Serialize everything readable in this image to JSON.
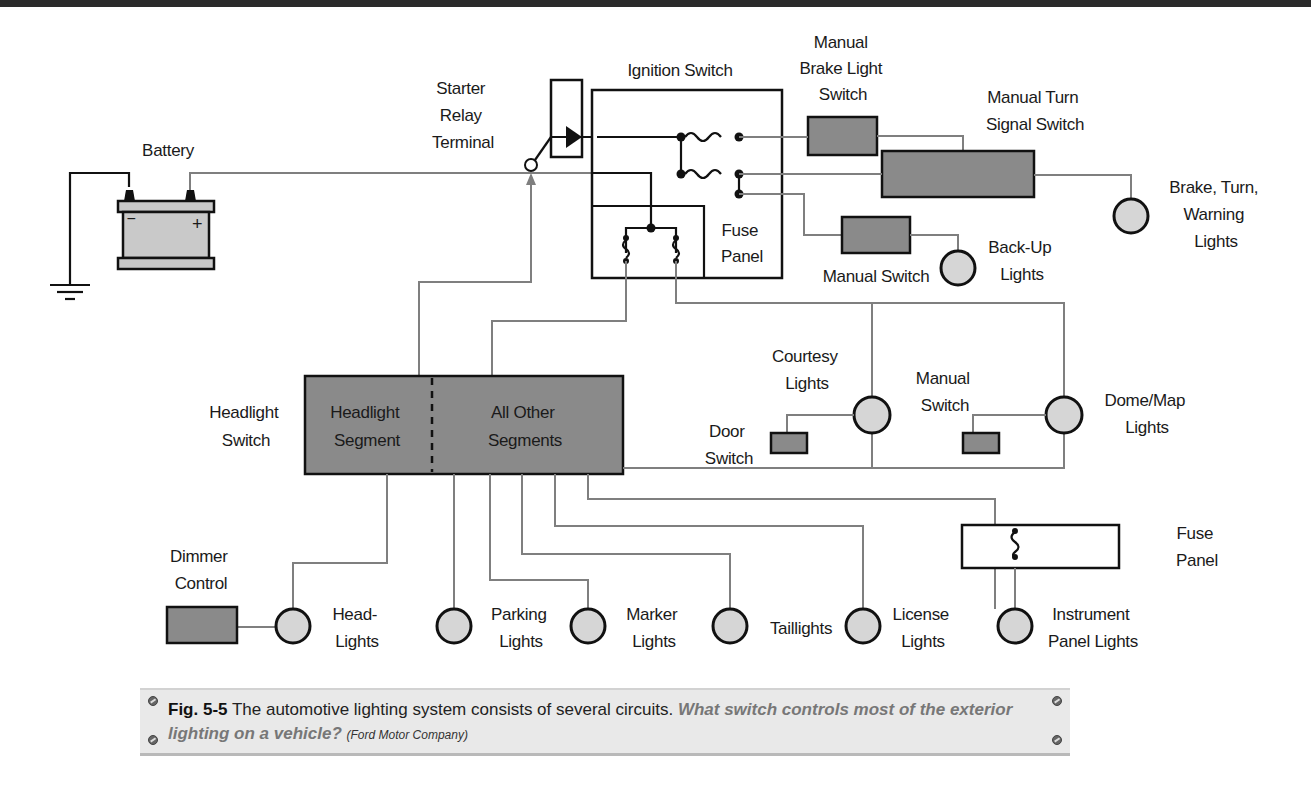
{
  "figure": {
    "labels": {
      "battery": "Battery",
      "battery_neg": "−",
      "battery_pos": "+",
      "starter_relay": [
        "Starter",
        "Relay",
        "Terminal"
      ],
      "ignition_switch": "Ignition Switch",
      "fuse_panel_top": [
        "Fuse",
        "Panel"
      ],
      "brake_light_switch": [
        "Manual",
        "Brake Light",
        "Switch"
      ],
      "turn_signal_switch": [
        "Manual Turn",
        "Signal Switch"
      ],
      "brake_turn_warning": [
        "Brake, Turn,",
        "Warning",
        "Lights"
      ],
      "manual_switch_backup": "Manual Switch",
      "backup_lights": [
        "Back-Up",
        "Lights"
      ],
      "headlight_switch": [
        "Headlight",
        "Switch"
      ],
      "headlight_segment": [
        "Headlight",
        "Segment"
      ],
      "other_segments": [
        "All Other",
        "Segments"
      ],
      "courtesy_lights": [
        "Courtesy",
        "Lights"
      ],
      "door_switch": [
        "Door",
        "Switch"
      ],
      "manual_switch_dome": [
        "Manual",
        "Switch"
      ],
      "dome_map_lights": [
        "Dome/Map",
        "Lights"
      ],
      "fuse_panel_bottom": [
        "Fuse",
        "Panel"
      ],
      "dimmer_control": [
        "Dimmer",
        "Control"
      ],
      "head_lights": [
        "Head-",
        "Lights"
      ],
      "parking_lights": [
        "Parking",
        "Lights"
      ],
      "marker_lights": [
        "Marker",
        "Lights"
      ],
      "taillights": "Taillights",
      "license_lights": [
        "License",
        "Lights"
      ],
      "instrument_panel_lights": [
        "Instrument",
        "Panel Lights"
      ]
    }
  },
  "caption": {
    "fig_label": "Fig. 5-5",
    "text": " The automotive lighting system consists of several circuits. ",
    "question": "What switch controls most of the exterior lighting on a vehicle?",
    "credit": "(Ford Motor Company)"
  },
  "colors": {
    "component_fill": "#8a8a8a",
    "lamp_fill": "#d6d6d6",
    "wire_gray": "#7f7f7f",
    "wire_black": "#111111",
    "caption_bg": "#e9e9e9"
  }
}
